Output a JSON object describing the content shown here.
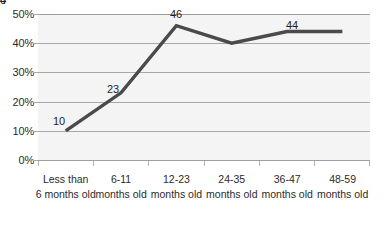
{
  "chart_data": {
    "type": "line",
    "title": "",
    "subtitle": "",
    "xlabel": "",
    "ylabel": "",
    "categories": [
      "Less than 6 months old",
      "6-11 months old",
      "12-23 months old",
      "24-35 months old",
      "36-47 months old",
      "48-59 months old"
    ],
    "category_lines": [
      [
        "Less than",
        "6 months old"
      ],
      [
        "6-11",
        "months old"
      ],
      [
        "12-23",
        "months old"
      ],
      [
        "24-35",
        "months old"
      ],
      [
        "36-47",
        "months old"
      ],
      [
        "48-59",
        "months old"
      ]
    ],
    "values": [
      10,
      23,
      46,
      40,
      44,
      44
    ],
    "data_labels": [
      "10",
      "23",
      "46",
      "40",
      "44",
      "44"
    ],
    "ylim": [
      0,
      50
    ],
    "ytick_values": [
      0,
      10,
      20,
      30,
      40,
      50
    ],
    "ytick_labels": [
      "0%",
      "10%",
      "20%",
      "30%",
      "40%",
      "50%"
    ],
    "grid": true,
    "legend": "none",
    "series": [
      {
        "name": "",
        "values": [
          10,
          23,
          46,
          40,
          44,
          44
        ],
        "color": "#4a4a4a"
      }
    ]
  },
  "style": {
    "line_color": "#4a4a4a",
    "plot_background": "#f4f4f4",
    "gridline_color": "#a8a8a8",
    "text_color": "#2b2b2b",
    "page_background": "#ffffff"
  }
}
